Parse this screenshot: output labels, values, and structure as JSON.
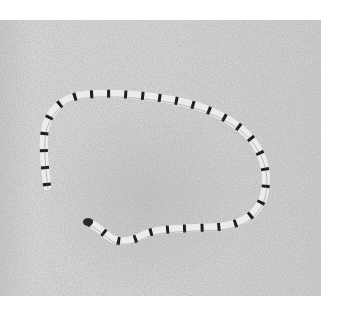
{
  "image": {
    "subject": "banded snake coiled on sand",
    "style": "grayscale photograph",
    "colors": {
      "background": "#ffffff",
      "sand": "#d2d2d2",
      "snake_light": "#e8e8e8",
      "snake_band": "#222222"
    }
  }
}
